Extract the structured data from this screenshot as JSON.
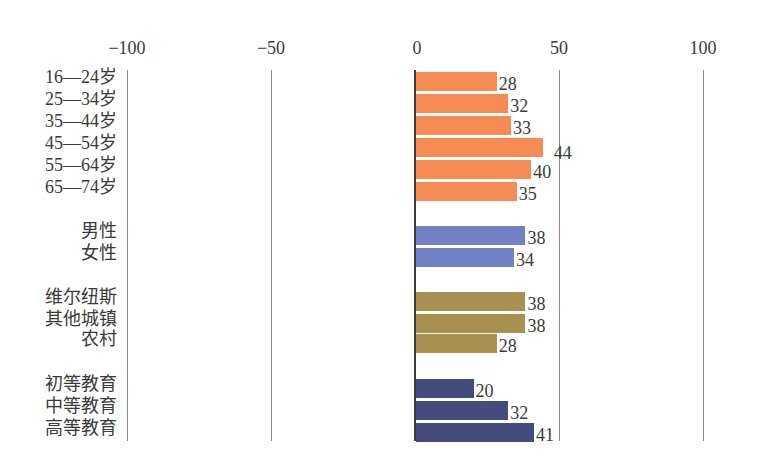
{
  "chart_data": {
    "type": "bar",
    "orientation": "horizontal",
    "title": "",
    "xlabel": "",
    "ylabel": "",
    "xlim": [
      -100,
      100
    ],
    "x_ticks": [
      "−100",
      "−50",
      "0",
      "50",
      "100"
    ],
    "x_tick_values": [
      -100,
      -50,
      0,
      50,
      100
    ],
    "grid": true,
    "legend": null,
    "groups": [
      {
        "name": "age",
        "color": "#F68B55",
        "categories": [
          "16—24岁",
          "25—34岁",
          "35—44岁",
          "45—54岁",
          "55—64岁",
          "65—74岁"
        ],
        "values": [
          28,
          32,
          33,
          44,
          40,
          35
        ]
      },
      {
        "name": "gender",
        "color": "#7281C4",
        "categories": [
          "男性",
          "女性"
        ],
        "values": [
          38,
          34
        ]
      },
      {
        "name": "location",
        "color": "#A89150",
        "categories": [
          "维尔纽斯",
          "其他城镇",
          "农村"
        ],
        "values": [
          38,
          38,
          28
        ]
      },
      {
        "name": "education",
        "color": "#454B7C",
        "categories": [
          "初等教育",
          "中等教育",
          "高等教育"
        ],
        "values": [
          20,
          32,
          41
        ]
      }
    ]
  },
  "layout": {
    "zero_x": 415,
    "px_per_unit": 2.88,
    "rows_y": [
      [
        72,
        94,
        116,
        138,
        160,
        182
      ],
      [
        226,
        248
      ],
      [
        292,
        314,
        334
      ],
      [
        379,
        401,
        423
      ]
    ],
    "label_offsets": [
      [
        0,
        0,
        0,
        9,
        0,
        0
      ],
      [
        0,
        0
      ],
      [
        0,
        0,
        0
      ],
      [
        0,
        0,
        0
      ]
    ]
  }
}
